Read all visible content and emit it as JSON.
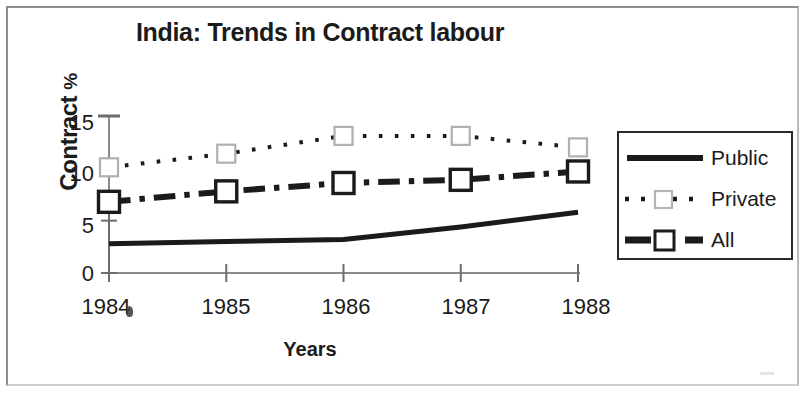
{
  "document": {
    "kind": "scanned-figure",
    "background_color": "#ffffff",
    "ink_color": "#1b1b1b",
    "frame_color": "#8d8d8d"
  },
  "chart_data": {
    "type": "line",
    "title": "India: Trends in Contract labour",
    "xlabel": "Years",
    "ylabel": "Contract %",
    "categories": [
      "1984",
      "1985",
      "1986",
      "1987",
      "1988"
    ],
    "x": [
      1984,
      1985,
      1986,
      1987,
      1988
    ],
    "xlim": [
      1984,
      1988
    ],
    "ylim": [
      0,
      15
    ],
    "yticks": [
      0,
      5,
      10,
      15
    ],
    "ytick_labels": [
      "0",
      "5",
      "10",
      "15"
    ],
    "grid": false,
    "legend_position": "right",
    "series": [
      {
        "name": "Public",
        "values": [
          2.8,
          3.0,
          3.2,
          4.4,
          5.8
        ],
        "style": "solid",
        "marker": "none",
        "line_width": 5,
        "color": "#1b1b1b"
      },
      {
        "name": "Private",
        "values": [
          10.1,
          11.4,
          13.1,
          13.1,
          12.0
        ],
        "style": "dotted",
        "marker": "open-square",
        "line_width": 4,
        "color": "#1b1b1b"
      },
      {
        "name": "All",
        "values": [
          6.8,
          7.8,
          8.6,
          8.9,
          9.7
        ],
        "style": "dash-dot",
        "marker": "open-square",
        "line_width": 6,
        "color": "#1b1b1b"
      }
    ],
    "annotations": [
      {
        "name": "error-bar-1984",
        "description": "vertical capped error bar at x=1984 spanning about 6.8 to 15",
        "x": 1984,
        "low": 6.8,
        "high": 15.0
      }
    ]
  },
  "legend": {
    "items": [
      {
        "label": "Public",
        "style": "solid",
        "marker": "none"
      },
      {
        "label": "Private",
        "style": "dotted",
        "marker": "open-square"
      },
      {
        "label": "All",
        "style": "dash-dot",
        "marker": "open-square"
      }
    ]
  },
  "axes": {
    "y_title_main": "Contract",
    "y_title_unit": "%",
    "x_title": "Years"
  }
}
